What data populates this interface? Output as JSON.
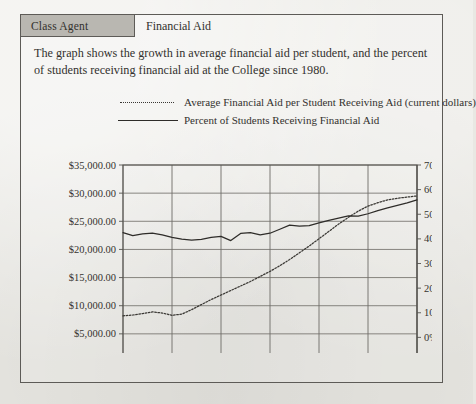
{
  "document": {
    "tab_label": "Class Agent",
    "heading": "Financial Aid",
    "description": "The graph shows the growth in average financial aid per student, and the percent of students receiving financial aid at the College since 1980."
  },
  "legend": {
    "items": [
      {
        "style": "dotted",
        "label": "Average Financial Aid per Student Receiving Aid (current dollars)"
      },
      {
        "style": "solid",
        "label": "Percent of Students Receiving Financial Aid"
      }
    ]
  },
  "chart_data": {
    "type": "line",
    "title": "",
    "xlabel": "",
    "ylabel": "",
    "grid": true,
    "legend_position": "above-plot",
    "x": [
      1980,
      1981,
      1982,
      1983,
      1984,
      1985,
      1986,
      1987,
      1988,
      1989,
      1990,
      1991,
      1992,
      1993,
      1994,
      1995,
      1996,
      1997,
      1998,
      1999,
      2000,
      2001,
      2002,
      2003,
      2004,
      2005,
      2006,
      2007,
      2008,
      2009,
      2010
    ],
    "xlim": [
      1980,
      2010
    ],
    "xticks": [
      1980,
      1985,
      1990,
      1995,
      2000,
      2005,
      2010
    ],
    "xtick_labels": [
      "1980",
      "1985",
      "1990",
      "1995",
      "2000",
      "2005",
      "2010"
    ],
    "axes": [
      {
        "id": "left",
        "name": "Average Financial Aid per Student (current dollars)",
        "ylim": [
          0,
          35000
        ],
        "yticks": [
          0,
          5000,
          10000,
          15000,
          20000,
          25000,
          30000,
          35000
        ],
        "ytick_labels": [
          "$-",
          "$5,000.00",
          "$10,000.00",
          "$15,000.00",
          "$20,000.00",
          "$25,000.00",
          "$30,000.00",
          "$35,000.00"
        ]
      },
      {
        "id": "right",
        "name": "Percent of Students Receiving Financial Aid",
        "ylim": [
          -10,
          70
        ],
        "yticks": [
          -10,
          0,
          10,
          20,
          30,
          40,
          50,
          60,
          70
        ],
        "ytick_labels": [
          "-10%",
          "0%",
          "10%",
          "20%",
          "30%",
          "40%",
          "50%",
          "60%",
          "70%"
        ]
      }
    ],
    "series": [
      {
        "name": "Average Financial Aid per Student Receiving Aid (current dollars)",
        "axis": "left",
        "style": "dotted",
        "color": "#3a3834",
        "values": [
          8200,
          8350,
          8600,
          8900,
          8700,
          8300,
          8500,
          9300,
          10200,
          11100,
          11900,
          12700,
          13500,
          14300,
          15200,
          16100,
          17100,
          18200,
          19400,
          20600,
          21900,
          23200,
          24500,
          25700,
          26800,
          27700,
          28300,
          28800,
          29100,
          29300,
          29500
        ]
      },
      {
        "name": "Percent of Students Receiving Financial Aid",
        "axis": "right",
        "style": "solid",
        "color": "#2e2c29",
        "values": [
          42.5,
          41.3,
          42.0,
          42.3,
          41.6,
          40.6,
          39.9,
          39.5,
          39.8,
          40.6,
          41.0,
          39.3,
          42.2,
          42.5,
          41.6,
          42.3,
          43.9,
          45.6,
          45.2,
          45.4,
          46.5,
          47.5,
          48.4,
          49.3,
          49.2,
          50.2,
          51.5,
          52.6,
          53.6,
          54.6,
          55.8
        ]
      }
    ]
  }
}
